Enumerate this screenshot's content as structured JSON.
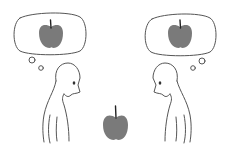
{
  "illustration": {
    "description": "Two stick figures facing each other with heads bowed, each imagining an apple in a thought bubble, with a real apple between them",
    "colors": {
      "background": "#ffffff",
      "line": "#555555",
      "apple": "#7a7a7a",
      "stem": "#222222"
    },
    "elements": [
      {
        "name": "left-thought-bubble",
        "contains": "apple"
      },
      {
        "name": "right-thought-bubble",
        "contains": "apple"
      },
      {
        "name": "left-figure",
        "facing": "right"
      },
      {
        "name": "right-figure",
        "facing": "left"
      },
      {
        "name": "center-apple"
      }
    ]
  }
}
